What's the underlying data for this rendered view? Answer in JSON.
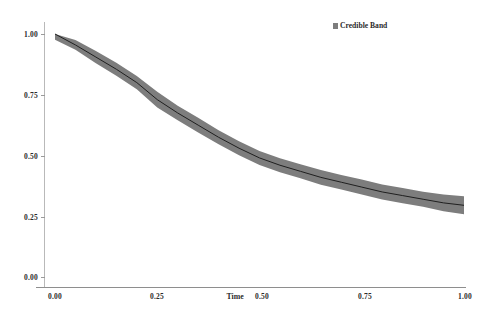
{
  "chart_data": {
    "type": "line",
    "title": "",
    "subtitle": "",
    "xlabel": "Time",
    "ylabel": "",
    "xlim": [
      0.0,
      1.0
    ],
    "ylim": [
      0.0,
      1.0
    ],
    "xticks": [
      "0.00",
      "0.25",
      "0.50",
      "0.75",
      "1.00"
    ],
    "xtick_values": [
      0.0,
      0.25,
      0.5,
      0.75,
      1.0
    ],
    "yticks": [
      "0.00",
      "0.25",
      "0.50",
      "0.75",
      "1.00"
    ],
    "ytick_values": [
      0.0,
      0.25,
      0.5,
      0.75,
      1.0
    ],
    "grid": false,
    "legend_position": "top-right",
    "legend": [
      {
        "label": "Credible Band",
        "marker": "filled-square",
        "color": "#7d7d7d"
      }
    ],
    "band_color": "#7d7d7d",
    "line_color": "#1f1f1f",
    "x": [
      0.0,
      0.05,
      0.1,
      0.15,
      0.2,
      0.25,
      0.3,
      0.35,
      0.4,
      0.45,
      0.5,
      0.55,
      0.6,
      0.65,
      0.7,
      0.75,
      0.8,
      0.85,
      0.9,
      0.95,
      1.0
    ],
    "series": [
      {
        "name": "Posterior mean",
        "values": [
          1.0,
          0.955,
          0.905,
          0.855,
          0.8,
          0.73,
          0.675,
          0.625,
          0.575,
          0.53,
          0.49,
          0.46,
          0.435,
          0.41,
          0.39,
          0.37,
          0.35,
          0.335,
          0.32,
          0.305,
          0.295
        ]
      },
      {
        "name": "Credible Band upper",
        "values": [
          1.0,
          0.975,
          0.93,
          0.882,
          0.827,
          0.762,
          0.705,
          0.655,
          0.604,
          0.559,
          0.519,
          0.489,
          0.464,
          0.44,
          0.42,
          0.401,
          0.381,
          0.366,
          0.351,
          0.34,
          0.332
        ]
      },
      {
        "name": "Credible Band lower",
        "values": [
          0.976,
          0.935,
          0.88,
          0.828,
          0.773,
          0.698,
          0.645,
          0.595,
          0.546,
          0.501,
          0.461,
          0.431,
          0.406,
          0.38,
          0.36,
          0.339,
          0.319,
          0.304,
          0.289,
          0.271,
          0.258
        ]
      }
    ]
  },
  "axis": {
    "x_title": "Time"
  },
  "legend": {
    "entry_label": "Credible Band"
  }
}
